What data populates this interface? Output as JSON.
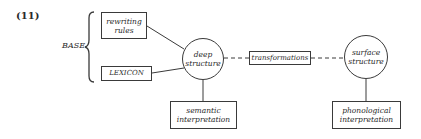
{
  "example_number": "(11)",
  "base_label": "BASE",
  "nodes": {
    "rewriting_rules": {
      "line1": "rewriting",
      "line2": "rules"
    },
    "lexicon": {
      "label": "LEXICON"
    },
    "deep_structure": {
      "line1": "deep",
      "line2": "structure"
    },
    "transformations": {
      "label": "transformations"
    },
    "surface_structure": {
      "line1": "surface",
      "line2": "structure"
    },
    "semantic_interpretation": {
      "line1": "semantic",
      "line2": "interpretation"
    },
    "phonological_interpretation": {
      "line1": "phonological",
      "line2": "interpretation"
    }
  },
  "edges": [
    {
      "from": "rewriting_rules",
      "to": "deep_structure",
      "style": "solid"
    },
    {
      "from": "lexicon",
      "to": "deep_structure",
      "style": "solid"
    },
    {
      "from": "deep_structure",
      "to": "transformations",
      "style": "dashed"
    },
    {
      "from": "transformations",
      "to": "surface_structure",
      "style": "dashed"
    },
    {
      "from": "deep_structure",
      "to": "semantic_interpretation",
      "style": "solid"
    },
    {
      "from": "surface_structure",
      "to": "phonological_interpretation",
      "style": "solid"
    }
  ],
  "colors": {
    "stroke": "#3a3a3a",
    "text": "#2a2a2a",
    "background": "#ffffff"
  }
}
